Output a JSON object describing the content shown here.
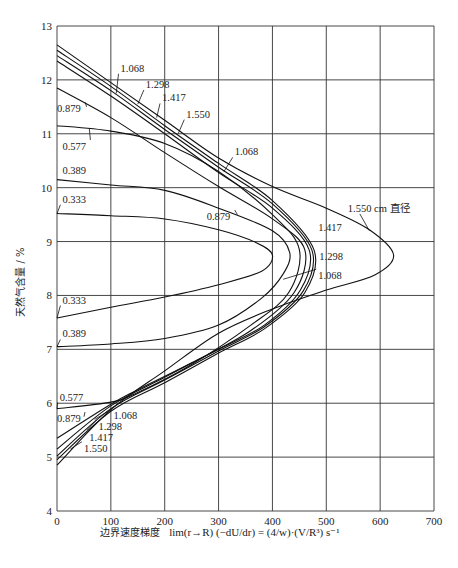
{
  "chart_data": {
    "type": "line",
    "title": "",
    "xlabel": "边界速度梯度 lim r→R (−dU/dr) = 4/w · V/R³ s⁻¹",
    "xlabel_text": "边界速度梯度",
    "xlabel_formula": "lim(r→R) (−dU/dr) = (4/w)·(V/R³) s⁻¹",
    "ylabel": "天然气含量 / %",
    "xlim": [
      0,
      700
    ],
    "ylim": [
      4,
      13
    ],
    "xticks": [
      0,
      100,
      200,
      300,
      400,
      500,
      600,
      700
    ],
    "yticks": [
      4,
      5,
      6,
      7,
      8,
      9,
      10,
      11,
      12,
      13
    ],
    "grid": true,
    "legend": "inline labels (diameter in cm)",
    "annotation": "1.550 cm 直径",
    "series": [
      {
        "name": "0.333",
        "points": [
          [
            0,
            9.52
          ],
          [
            100,
            9.48
          ],
          [
            200,
            9.42
          ],
          [
            300,
            9.22
          ],
          [
            370,
            8.98
          ],
          [
            400,
            8.75
          ],
          [
            380,
            8.45
          ],
          [
            300,
            8.2
          ],
          [
            200,
            7.97
          ],
          [
            100,
            7.78
          ],
          [
            0,
            7.58
          ]
        ]
      },
      {
        "name": "0.389",
        "points": [
          [
            0,
            10.15
          ],
          [
            100,
            10.05
          ],
          [
            200,
            9.95
          ],
          [
            300,
            9.62
          ],
          [
            400,
            9.2
          ],
          [
            432,
            8.8
          ],
          [
            420,
            8.4
          ],
          [
            380,
            7.95
          ],
          [
            300,
            7.45
          ],
          [
            200,
            7.2
          ],
          [
            100,
            7.1
          ],
          [
            0,
            7.05
          ]
        ]
      },
      {
        "name": "0.577",
        "points": [
          [
            0,
            11.15
          ],
          [
            100,
            11.05
          ],
          [
            200,
            10.82
          ],
          [
            300,
            10.3
          ],
          [
            400,
            9.5
          ],
          [
            450,
            8.85
          ],
          [
            430,
            8.05
          ],
          [
            360,
            7.45
          ],
          [
            250,
            6.72
          ],
          [
            150,
            6.2
          ],
          [
            100,
            6.02
          ],
          [
            0,
            5.9
          ]
        ]
      },
      {
        "name": "0.879",
        "points": [
          [
            0,
            11.85
          ],
          [
            100,
            11.3
          ],
          [
            200,
            10.65
          ],
          [
            300,
            10.02
          ],
          [
            400,
            9.42
          ],
          [
            460,
            8.85
          ],
          [
            440,
            8.05
          ],
          [
            360,
            7.35
          ],
          [
            250,
            6.75
          ],
          [
            150,
            6.25
          ],
          [
            100,
            5.98
          ],
          [
            0,
            5.35
          ]
        ]
      },
      {
        "name": "1.068",
        "points": [
          [
            0,
            12.35
          ],
          [
            100,
            11.7
          ],
          [
            200,
            11.0
          ],
          [
            300,
            10.28
          ],
          [
            400,
            9.62
          ],
          [
            468,
            8.85
          ],
          [
            452,
            8.1
          ],
          [
            385,
            7.45
          ],
          [
            300,
            7.0
          ],
          [
            200,
            6.48
          ],
          [
            100,
            5.95
          ],
          [
            0,
            5.15
          ]
        ]
      },
      {
        "name": "1.298",
        "points": [
          [
            0,
            12.45
          ],
          [
            100,
            11.8
          ],
          [
            200,
            11.08
          ],
          [
            300,
            10.38
          ],
          [
            400,
            9.7
          ],
          [
            473,
            8.85
          ],
          [
            457,
            8.08
          ],
          [
            385,
            7.42
          ],
          [
            300,
            6.97
          ],
          [
            200,
            6.43
          ],
          [
            100,
            5.9
          ],
          [
            0,
            5.02
          ]
        ]
      },
      {
        "name": "1.417",
        "points": [
          [
            0,
            12.55
          ],
          [
            100,
            11.88
          ],
          [
            200,
            11.15
          ],
          [
            300,
            10.45
          ],
          [
            400,
            9.76
          ],
          [
            477,
            8.85
          ],
          [
            460,
            8.05
          ],
          [
            385,
            7.38
          ],
          [
            300,
            6.93
          ],
          [
            200,
            6.38
          ],
          [
            100,
            5.85
          ],
          [
            0,
            4.95
          ]
        ]
      },
      {
        "name": "1.550",
        "points": [
          [
            0,
            12.65
          ],
          [
            100,
            11.95
          ],
          [
            200,
            11.25
          ],
          [
            300,
            10.55
          ],
          [
            400,
            10.02
          ],
          [
            500,
            9.62
          ],
          [
            580,
            9.22
          ],
          [
            625,
            8.75
          ],
          [
            590,
            8.38
          ],
          [
            500,
            8.1
          ],
          [
            400,
            7.75
          ],
          [
            300,
            7.3
          ],
          [
            200,
            6.6
          ],
          [
            100,
            5.88
          ],
          [
            0,
            4.85
          ]
        ]
      }
    ],
    "labels": [
      {
        "text": "1.068",
        "x": 110,
        "y": 11.75,
        "lx": 118,
        "ly": 12.15
      },
      {
        "text": "1.298",
        "x": 150,
        "y": 11.55,
        "lx": 165,
        "ly": 11.85
      },
      {
        "text": "1.417",
        "x": 185,
        "y": 11.3,
        "lx": 195,
        "ly": 11.6
      },
      {
        "text": "1.550",
        "x": 225,
        "y": 11.0,
        "lx": 240,
        "ly": 11.3
      },
      {
        "text": "0.879",
        "x": 55,
        "y": 11.5,
        "lx": 0,
        "ly": 11.4
      },
      {
        "text": "0.577",
        "x": 60,
        "y": 11.1,
        "lx": 10,
        "ly": 10.7
      },
      {
        "text": "1.068",
        "x": 310,
        "y": 10.3,
        "lx": 330,
        "ly": 10.6
      },
      {
        "text": "0.389",
        "x": 0,
        "y": 10.15,
        "lx": 10,
        "ly": 10.25
      },
      {
        "text": "0.333",
        "x": 0,
        "y": 9.52,
        "lx": 10,
        "ly": 9.72
      },
      {
        "text": "0.879",
        "x": 335,
        "y": 9.5,
        "lx": 278,
        "ly": 9.4
      },
      {
        "text": "1.550 cm 直径",
        "x": 580,
        "y": 9.2,
        "lx": 540,
        "ly": 9.55
      },
      {
        "text": "1.417",
        "x": 476,
        "y": 9.3,
        "lx": 485,
        "ly": 9.2
      },
      {
        "text": "1.298",
        "x": 475,
        "y": 8.7,
        "lx": 487,
        "ly": 8.65
      },
      {
        "text": "1.068",
        "x": 420,
        "y": 8.3,
        "lx": 485,
        "ly": 8.3
      },
      {
        "text": "0.333",
        "x": 0,
        "y": 7.58,
        "lx": 10,
        "ly": 7.85
      },
      {
        "text": "0.389",
        "x": 0,
        "y": 7.05,
        "lx": 10,
        "ly": 7.22
      },
      {
        "text": "0.577",
        "x": 0,
        "y": 5.9,
        "lx": 5,
        "ly": 6.05
      },
      {
        "text": "0.879",
        "x": 50,
        "y": 5.75,
        "lx": 0,
        "ly": 5.65
      },
      {
        "text": "1.068",
        "x": 70,
        "y": 5.7,
        "lx": 105,
        "ly": 5.7
      },
      {
        "text": "1.298",
        "x": 55,
        "y": 5.5,
        "lx": 77,
        "ly": 5.5
      },
      {
        "text": "1.417",
        "x": 40,
        "y": 5.35,
        "lx": 60,
        "ly": 5.3
      },
      {
        "text": "1.550",
        "x": 25,
        "y": 5.15,
        "lx": 50,
        "ly": 5.1
      }
    ]
  }
}
